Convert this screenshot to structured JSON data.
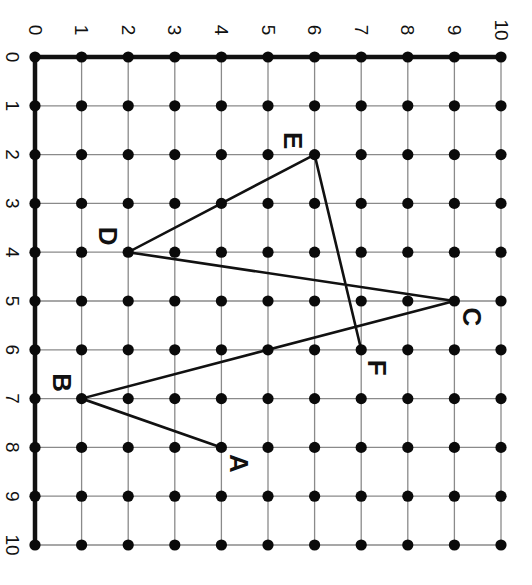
{
  "diagram": {
    "type": "coordinate-grid-polyline",
    "rotation_deg": 90,
    "x_axis": {
      "min": 0,
      "max": 10,
      "tick_labels": [
        "0",
        "1",
        "2",
        "3",
        "4",
        "5",
        "6",
        "7",
        "8",
        "9",
        "10"
      ]
    },
    "y_axis": {
      "min": 0,
      "max": 10,
      "tick_labels": [
        "0",
        "1",
        "2",
        "3",
        "4",
        "5",
        "6",
        "7",
        "8",
        "9",
        "10"
      ]
    },
    "points": [
      {
        "label": "A",
        "x": 8,
        "y": 4
      },
      {
        "label": "B",
        "x": 7,
        "y": 1
      },
      {
        "label": "C",
        "x": 5,
        "y": 9
      },
      {
        "label": "D",
        "x": 4,
        "y": 2
      },
      {
        "label": "E",
        "x": 2,
        "y": 6
      },
      {
        "label": "F",
        "x": 6,
        "y": 7
      }
    ],
    "path_order": [
      "A",
      "B",
      "C",
      "D",
      "E",
      "F"
    ],
    "colors": {
      "grid": "#8a8a8a",
      "axis": "#111111",
      "dot": "#0a0a0a",
      "segment": "#111111"
    }
  }
}
